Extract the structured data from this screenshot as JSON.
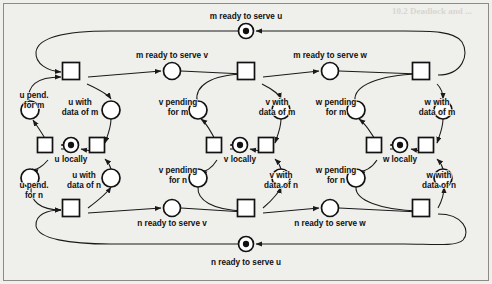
{
  "figure": {
    "type": "petri-net",
    "title_visible": false,
    "background_color": "#efefec",
    "ink_color": "#121212",
    "margin_artifact_text": "10.2 Deadlock and Liveness"
  },
  "places": [
    {
      "id": "m_serve_u",
      "label": "m ready to serve u",
      "tokens": 1,
      "cx": 246,
      "cy": 31,
      "r": 7.5,
      "label_x": 246,
      "label_y": 17,
      "label_lines": [
        "m ready to serve u"
      ]
    },
    {
      "id": "m_serve_v",
      "label": "m ready to serve v",
      "tokens": 0,
      "cx": 172,
      "cy": 71,
      "r": 8.5,
      "label_x": 172,
      "label_y": 56,
      "label_lines": [
        "m ready to serve v"
      ]
    },
    {
      "id": "m_serve_w",
      "label": "m ready to serve w",
      "tokens": 0,
      "cx": 330,
      "cy": 71,
      "r": 8.5,
      "label_x": 330,
      "label_y": 56,
      "label_lines": [
        "m ready to serve w"
      ]
    },
    {
      "id": "n_serve_u",
      "label": "n ready to serve u",
      "tokens": 1,
      "cx": 246,
      "cy": 244,
      "r": 7.5,
      "label_x": 246,
      "label_y": 263,
      "label_lines": [
        "n ready to serve u"
      ]
    },
    {
      "id": "n_serve_v",
      "label": "n ready to serve v",
      "tokens": 0,
      "cx": 172,
      "cy": 208,
      "r": 8.5,
      "label_x": 172,
      "label_y": 224,
      "label_lines": [
        "n ready to serve v"
      ]
    },
    {
      "id": "n_serve_w",
      "label": "n ready to serve w",
      "tokens": 0,
      "cx": 330,
      "cy": 208,
      "r": 8.5,
      "label_x": 330,
      "label_y": 224,
      "label_lines": [
        "n ready to serve w"
      ]
    },
    {
      "id": "u_pend_m",
      "label": "u pend. for m",
      "tokens": 0,
      "cx": 30,
      "cy": 110,
      "r": 9,
      "label_x": 34,
      "label_y": 96,
      "label_lines": [
        "u pend.",
        "for m"
      ]
    },
    {
      "id": "u_data_m",
      "label": "u with data of m",
      "tokens": 0,
      "cx": 111,
      "cy": 110,
      "r": 9,
      "label_x": 80,
      "label_y": 103,
      "label_lines": [
        "u with",
        "data of m"
      ]
    },
    {
      "id": "u_locally",
      "label": "u locally",
      "tokens": 1,
      "cx": 71,
      "cy": 145,
      "r": 7.5,
      "label_x": 71,
      "label_y": 160,
      "label_lines": [
        "u locally"
      ]
    },
    {
      "id": "u_pend_n",
      "label": "u pend. for n",
      "tokens": 0,
      "cx": 30,
      "cy": 178,
      "r": 9,
      "label_x": 34,
      "label_y": 186,
      "label_lines": [
        "u pend.",
        "for n"
      ]
    },
    {
      "id": "u_data_n",
      "label": "u with data of n",
      "tokens": 0,
      "cx": 111,
      "cy": 178,
      "r": 9,
      "label_x": 84,
      "label_y": 176,
      "label_lines": [
        "u with",
        "data of n"
      ]
    },
    {
      "id": "v_pend_m",
      "label": "v pending for m",
      "tokens": 0,
      "cx": 198,
      "cy": 110,
      "r": 9,
      "label_x": 178,
      "label_y": 103,
      "label_lines": [
        "v pending",
        "for m"
      ]
    },
    {
      "id": "v_data_m",
      "label": "v with data of m",
      "tokens": 0,
      "cx": 281,
      "cy": 110,
      "r": 9,
      "label_x": 277,
      "label_y": 103,
      "label_lines": [
        "v with",
        "data of m"
      ]
    },
    {
      "id": "v_locally",
      "label": "v locally",
      "tokens": 1,
      "cx": 240,
      "cy": 145,
      "r": 7.5,
      "label_x": 240,
      "label_y": 160,
      "label_lines": [
        "v locally"
      ]
    },
    {
      "id": "v_pend_n",
      "label": "v pending for n",
      "tokens": 0,
      "cx": 198,
      "cy": 178,
      "r": 9,
      "label_x": 178,
      "label_y": 171,
      "label_lines": [
        "v pending",
        "for n"
      ]
    },
    {
      "id": "v_data_n",
      "label": "v with data of n",
      "tokens": 0,
      "cx": 281,
      "cy": 178,
      "r": 9,
      "label_x": 281,
      "label_y": 176,
      "label_lines": [
        "v with",
        "data of n"
      ]
    },
    {
      "id": "w_pend_m",
      "label": "w pending for m",
      "tokens": 0,
      "cx": 356,
      "cy": 110,
      "r": 9,
      "label_x": 336,
      "label_y": 103,
      "label_lines": [
        "w pending",
        "for m"
      ]
    },
    {
      "id": "w_data_m",
      "label": "w with data of m",
      "tokens": 0,
      "cx": 443,
      "cy": 110,
      "r": 9,
      "label_x": 437,
      "label_y": 103,
      "label_lines": [
        "w with",
        "data of m"
      ]
    },
    {
      "id": "w_locally",
      "label": "w locally",
      "tokens": 1,
      "cx": 400,
      "cy": 145,
      "r": 7.5,
      "label_x": 400,
      "label_y": 160,
      "label_lines": [
        "w locally"
      ]
    },
    {
      "id": "w_pend_n",
      "label": "w pending for n",
      "tokens": 0,
      "cx": 356,
      "cy": 178,
      "r": 9,
      "label_x": 336,
      "label_y": 171,
      "label_lines": [
        "w pending",
        "for n"
      ]
    },
    {
      "id": "w_data_n",
      "label": "w with data of n",
      "tokens": 0,
      "cx": 443,
      "cy": 178,
      "r": 9,
      "label_x": 439,
      "label_y": 176,
      "label_lines": [
        "w with",
        "data of n"
      ]
    }
  ],
  "transitions": [
    {
      "id": "t_u_top",
      "x": 71,
      "y": 71,
      "w": 17,
      "h": 17
    },
    {
      "id": "t_v_top",
      "x": 246,
      "y": 71,
      "w": 17,
      "h": 17
    },
    {
      "id": "t_w_top",
      "x": 421,
      "y": 71,
      "w": 17,
      "h": 17
    },
    {
      "id": "t_u_bot",
      "x": 71,
      "y": 208,
      "w": 17,
      "h": 17
    },
    {
      "id": "t_v_bot",
      "x": 246,
      "y": 208,
      "w": 17,
      "h": 17
    },
    {
      "id": "t_w_bot",
      "x": 421,
      "y": 208,
      "w": 17,
      "h": 17
    },
    {
      "id": "t_u_left",
      "x": 45,
      "y": 145,
      "w": 15,
      "h": 15
    },
    {
      "id": "t_u_right",
      "x": 97,
      "y": 145,
      "w": 15,
      "h": 15
    },
    {
      "id": "t_v_left",
      "x": 214,
      "y": 145,
      "w": 15,
      "h": 15
    },
    {
      "id": "t_v_right",
      "x": 266,
      "y": 145,
      "w": 15,
      "h": 15
    },
    {
      "id": "t_w_left",
      "x": 374,
      "y": 145,
      "w": 15,
      "h": 15
    },
    {
      "id": "t_w_right",
      "x": 426,
      "y": 145,
      "w": 15,
      "h": 15
    }
  ],
  "legend": {
    "servers": [
      "m",
      "n"
    ],
    "clients": [
      "u",
      "v",
      "w"
    ],
    "total_tokens": 5
  }
}
